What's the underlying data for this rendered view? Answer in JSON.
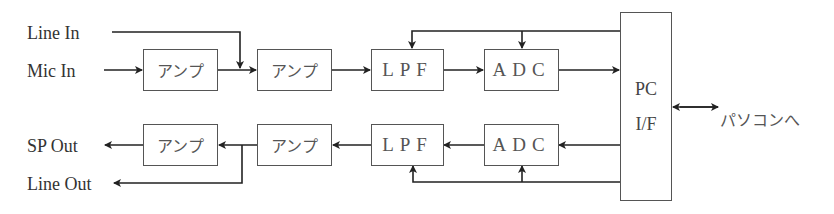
{
  "diagram": {
    "inputs": {
      "line_in": "Line In",
      "mic_in": "Mic In"
    },
    "outputs": {
      "sp_out": "SP Out",
      "line_out": "Line Out"
    },
    "top_chain": [
      {
        "id": "amp1",
        "label": "アンプ"
      },
      {
        "id": "amp2",
        "label": "アンプ"
      },
      {
        "id": "lpf",
        "label": "LPF"
      },
      {
        "id": "adc",
        "label": "ADC"
      }
    ],
    "bottom_chain": [
      {
        "id": "amp3",
        "label": "アンプ"
      },
      {
        "id": "amp4",
        "label": "アンプ"
      },
      {
        "id": "lpf2",
        "label": "LPF"
      },
      {
        "id": "adc2",
        "label": "ADC"
      }
    ],
    "pc_if": {
      "line1": "PC",
      "line2": "I/F"
    },
    "pc_link_label": "パソコンへ",
    "colors": {
      "line": "#222222",
      "box_border": "#555555",
      "text": "#333333"
    }
  }
}
